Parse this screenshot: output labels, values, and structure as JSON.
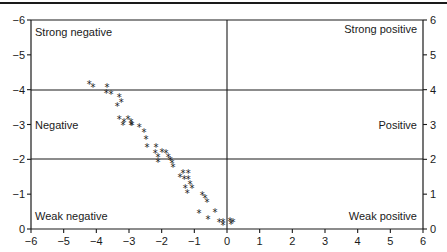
{
  "chart_data": {
    "type": "scatter",
    "title": "",
    "xlabel": "",
    "ylabel_left": "",
    "ylabel_right": "",
    "xlim": [
      -6,
      6
    ],
    "ylim": [
      0,
      6
    ],
    "x_ticks": [
      "-6",
      "-5",
      "-4",
      "-3",
      "-2",
      "-1",
      "0",
      "1",
      "2",
      "3",
      "4",
      "5",
      "6"
    ],
    "y_ticks_left": [
      "0",
      "-1",
      "-2",
      "-3",
      "-4",
      "-5",
      "-6"
    ],
    "y_ticks_right": [
      "0",
      "1",
      "2",
      "3",
      "4",
      "5",
      "6"
    ],
    "grid": false,
    "reference_lines": {
      "horizontal": [
        2,
        4,
        6
      ],
      "vertical": [
        0
      ]
    },
    "region_labels": {
      "strong_negative": "Strong negative",
      "negative": "Negative",
      "weak_negative": "Weak negative",
      "strong_positive": "Strong positive",
      "positive": "Positive",
      "weak_positive": "Weak positive"
    },
    "marker": "*",
    "series": [
      {
        "name": "points",
        "points": [
          [
            -4.22,
            4.17
          ],
          [
            -4.1,
            4.08
          ],
          [
            -3.67,
            4.08
          ],
          [
            -3.7,
            3.91
          ],
          [
            -3.55,
            3.88
          ],
          [
            -3.3,
            3.79
          ],
          [
            -3.24,
            3.65
          ],
          [
            -3.36,
            3.53
          ],
          [
            -3.3,
            3.16
          ],
          [
            -3.15,
            3.07
          ],
          [
            -3.18,
            2.99
          ],
          [
            -3.03,
            3.16
          ],
          [
            -2.94,
            3.07
          ],
          [
            -2.94,
            2.99
          ],
          [
            -2.91,
            2.99
          ],
          [
            -2.69,
            2.93
          ],
          [
            -2.54,
            2.79
          ],
          [
            -2.48,
            2.59
          ],
          [
            -2.45,
            2.36
          ],
          [
            -2.17,
            2.36
          ],
          [
            -2.2,
            2.18
          ],
          [
            -1.99,
            2.21
          ],
          [
            -2.11,
            2.07
          ],
          [
            -2.11,
            1.93
          ],
          [
            -1.87,
            2.18
          ],
          [
            -1.8,
            2.07
          ],
          [
            -1.74,
            1.98
          ],
          [
            -1.68,
            1.9
          ],
          [
            -1.65,
            1.78
          ],
          [
            -1.44,
            1.49
          ],
          [
            -1.35,
            1.61
          ],
          [
            -1.19,
            1.61
          ],
          [
            -1.31,
            1.44
          ],
          [
            -1.19,
            1.44
          ],
          [
            -1.13,
            1.29
          ],
          [
            -1.07,
            1.18
          ],
          [
            -1.28,
            1.18
          ],
          [
            -1.22,
            1.03
          ],
          [
            -0.76,
            0.98
          ],
          [
            -0.67,
            0.89
          ],
          [
            -0.61,
            0.78
          ],
          [
            -0.86,
            0.46
          ],
          [
            -0.37,
            0.49
          ],
          [
            -0.58,
            0.29
          ],
          [
            -0.24,
            0.2
          ],
          [
            -0.12,
            0.2
          ],
          [
            -0.12,
            0.11
          ],
          [
            0.09,
            0.23
          ],
          [
            0.18,
            0.2
          ],
          [
            0.12,
            0.14
          ]
        ]
      }
    ]
  }
}
